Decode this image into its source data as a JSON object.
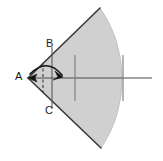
{
  "figure": {
    "type": "geometry-diagram",
    "canvas": {
      "width": 163,
      "height": 161,
      "background": "#ffffff"
    },
    "labels": {
      "apex": "A",
      "upper": "B",
      "lower": "C"
    },
    "colors": {
      "sector_fill": "#d0d0d0",
      "sector_stroke": "#3a3a3a",
      "axis_stroke": "#4a4a4a",
      "tick_stroke": "#7a7a7a",
      "arrow_stroke": "#1a1a1a",
      "dashed_stroke": "#3a3a3a",
      "label_color": "#1a1a1a"
    },
    "geometry": {
      "apex_point": {
        "x": 28,
        "y": 78
      },
      "upper_edge_end": {
        "x": 100,
        "y": 8
      },
      "lower_edge_end": {
        "x": 101,
        "y": 148
      },
      "arc_radius": 124,
      "arc_rightmost_x": 152,
      "half_angle_degrees": 44,
      "axis_line": {
        "x1": 28,
        "y1": 78,
        "x2": 152,
        "y2": 78
      },
      "chord_line": {
        "x": 52,
        "y1": 47,
        "y2": 109
      },
      "dashed_line": {
        "x": 43,
        "y1": 63,
        "y2": 93
      },
      "tick_marks": [
        {
          "x": 75,
          "y1": 55,
          "y2": 101
        },
        {
          "x": 123,
          "y1": 55,
          "y2": 101
        }
      ],
      "angle_arrow": {
        "start": {
          "x": 31,
          "y": 73
        },
        "control": {
          "x": 48,
          "y": 58
        },
        "end": {
          "x": 63,
          "y": 76
        },
        "arrowhead_direction": "right"
      }
    }
  }
}
